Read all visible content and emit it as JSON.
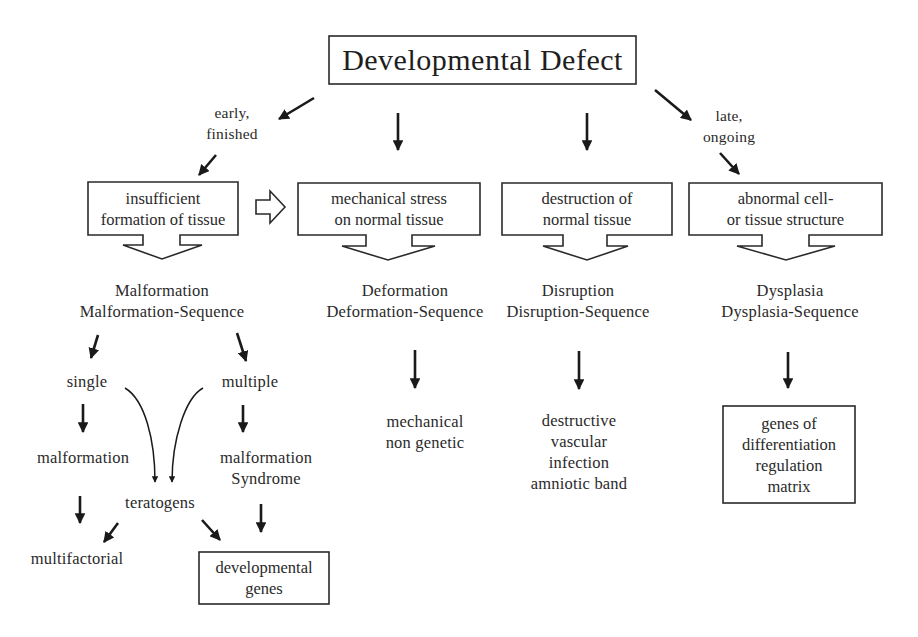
{
  "title": "Developmental Defect",
  "timing": {
    "early": [
      "early,",
      "finished"
    ],
    "late": [
      "late,",
      "ongoing"
    ]
  },
  "causes": [
    {
      "id": "insufficient",
      "lines": [
        "insufficient",
        "formation of tissue"
      ]
    },
    {
      "id": "mechanical",
      "lines": [
        "mechanical stress",
        "on normal tissue"
      ]
    },
    {
      "id": "destruction",
      "lines": [
        "destruction of",
        "normal tissue"
      ]
    },
    {
      "id": "abnormal",
      "lines": [
        "abnormal cell-",
        "or tissue structure"
      ]
    }
  ],
  "categories": [
    {
      "id": "malformation",
      "lines": [
        "Malformation",
        "Malformation-Sequence"
      ]
    },
    {
      "id": "deformation",
      "lines": [
        "Deformation",
        "Deformation-Sequence"
      ]
    },
    {
      "id": "disruption",
      "lines": [
        "Disruption",
        "Disruption-Sequence"
      ]
    },
    {
      "id": "dysplasia",
      "lines": [
        "Dysplasia",
        "Dysplasia-Sequence"
      ]
    }
  ],
  "malformation_branch": {
    "single": "single",
    "multiple": "multiple",
    "malformation": "malformation",
    "syndrome": [
      "malformation",
      "Syndrome"
    ],
    "teratogens": "teratogens",
    "multifactorial": "multifactorial",
    "developmental_genes": [
      "developmental",
      "genes"
    ]
  },
  "deformation_causes": [
    "mechanical",
    "non genetic"
  ],
  "disruption_causes": [
    "destructive",
    "vascular",
    "infection",
    "amniotic band"
  ],
  "dysplasia_causes": [
    "genes of",
    "differentiation",
    "regulation",
    "matrix"
  ],
  "colors": {
    "line": "#1a1a1a",
    "text": "#2a2a2a",
    "background": "#ffffff"
  }
}
